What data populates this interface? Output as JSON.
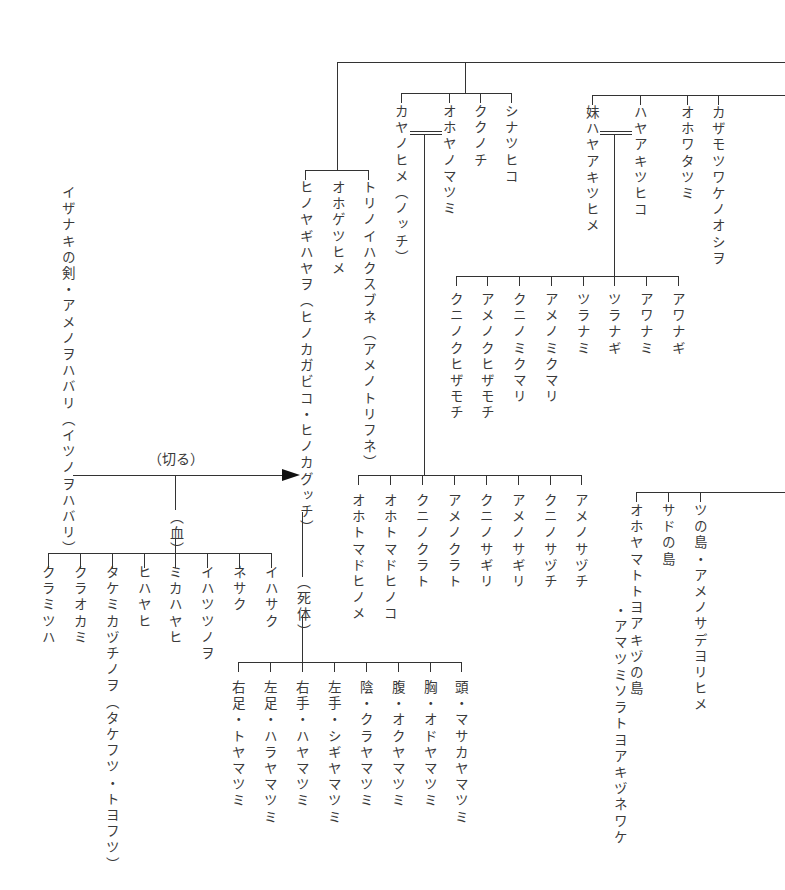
{
  "diagram": {
    "type": "genealogy",
    "top_group": {
      "left_branch": [
        {
          "name": "ヒノヤギハヤヲ（ヒノカガビコ・ヒノカグッチ）"
        },
        {
          "name": "オホゲツヒメ"
        },
        {
          "name": "トリノイハクスブネ（アメノトリフネ）"
        }
      ],
      "kaya_group": [
        {
          "name": "カヤノヒメ（ノッチ）"
        },
        {
          "name": "オホヤノマツミ"
        },
        {
          "name": "ククノチ"
        },
        {
          "name": "シナツヒコ"
        }
      ],
      "haya_group": [
        {
          "name": "妹ハヤアキツヒメ"
        },
        {
          "name": "ハヤアキツヒコ"
        },
        {
          "name": "オホワタツミ"
        },
        {
          "name": "カザモツワケノオシヲ"
        }
      ]
    },
    "haya_children": [
      {
        "name": "クニノクヒザモチ"
      },
      {
        "name": "アメノクヒザモチ"
      },
      {
        "name": "クニノミクマリ"
      },
      {
        "name": "アメノミクマリ"
      },
      {
        "name": "ツラナミ"
      },
      {
        "name": "ツラナギ"
      },
      {
        "name": "アワナミ"
      },
      {
        "name": "アワナギ"
      }
    ],
    "kaya_children": [
      {
        "name": "オホトマドヒノメ"
      },
      {
        "name": "オホトマドヒノコ"
      },
      {
        "name": "クニノクラト"
      },
      {
        "name": "アメノクラト"
      },
      {
        "name": "クニノサギリ"
      },
      {
        "name": "アメノサギリ"
      },
      {
        "name": "クニノサヅチ"
      },
      {
        "name": "アメノサヅチ"
      }
    ],
    "islands": [
      {
        "name": "オホヤマトトヨアキヅの島",
        "sub": "・アマツミソラトヨアキヅネワケ"
      },
      {
        "name": "サドの島"
      },
      {
        "name": "ツの島・アメノサデヨリヒメ"
      }
    ],
    "sword": {
      "name": "イザナキの剣・アメノヲハバリ（イツノヲハバリ）"
    },
    "cut_label": "（切る）",
    "blood_label": "（血）",
    "corpse_label": "（死体）",
    "blood_children": [
      {
        "name": "クラミツハ"
      },
      {
        "name": "クラオカミ"
      },
      {
        "name": "タケミカヅチノヲ（タケフツ・トヨフツ）"
      },
      {
        "name": "ヒハヤヒ"
      },
      {
        "name": "ミカハヤヒ"
      },
      {
        "name": "イハツツノヲ"
      },
      {
        "name": "ネサク"
      },
      {
        "name": "イハサク"
      }
    ],
    "corpse_children": [
      {
        "name": "右足・トヤマツミ"
      },
      {
        "name": "左足・ハラヤマツミ"
      },
      {
        "name": "右手・ハヤマツミ"
      },
      {
        "name": "左手・シギヤマツミ"
      },
      {
        "name": "陰・クラヤマツミ"
      },
      {
        "name": "腹・オクヤマツミ"
      },
      {
        "name": "胸・オドヤマツミ"
      },
      {
        "name": "頭・マサカヤマツミ"
      }
    ]
  }
}
